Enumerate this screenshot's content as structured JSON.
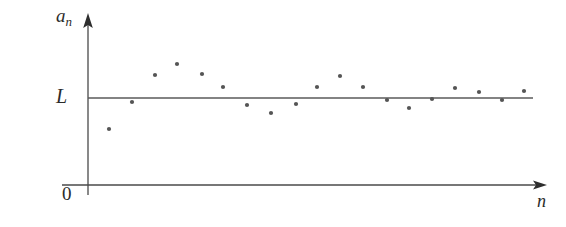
{
  "figure": {
    "background_color": "#ffffff",
    "axis_color": "#4a4a4a",
    "point_color": "#555555",
    "labels": {
      "y_axis": "a",
      "y_axis_subscript": "n",
      "limit_line": "L",
      "origin": "0",
      "x_axis": "n"
    }
  },
  "chart_data": {
    "type": "scatter",
    "title": "",
    "xlabel": "n",
    "ylabel": "a_n",
    "grid": false,
    "legend": false,
    "annotations": [
      {
        "text": "L",
        "meaning": "limit value, horizontal reference line",
        "y_pixel": 98
      },
      {
        "text": "0",
        "meaning": "origin",
        "x_pixel": 88,
        "y_pixel": 185
      }
    ],
    "reference_lines": [
      {
        "name": "limit-line",
        "orientation": "horizontal",
        "label": "L",
        "x_start_px": 88,
        "x_end_px": 533,
        "y_px": 98
      }
    ],
    "axes": {
      "x_axis_px": {
        "x_start": 62,
        "x_end": 547,
        "y": 185,
        "arrow": "right"
      },
      "y_axis_px": {
        "x": 88,
        "y_start": 185,
        "y_end": 14,
        "arrow": "up"
      }
    },
    "x": [
      1,
      2,
      3,
      4,
      5,
      6,
      7,
      8,
      9,
      10,
      11,
      12,
      13,
      14,
      15,
      16,
      17,
      18,
      19
    ],
    "values": [
      -0.72,
      -0.09,
      0.53,
      0.79,
      0.55,
      0.25,
      -0.16,
      -0.34,
      -0.14,
      0.25,
      0.5,
      0.25,
      -0.05,
      -0.23,
      -0.02,
      0.23,
      0.14,
      -0.05,
      0.16
    ],
    "points_px": [
      {
        "x": 109,
        "y": 129
      },
      {
        "x": 132,
        "y": 102
      },
      {
        "x": 155,
        "y": 75
      },
      {
        "x": 177,
        "y": 64
      },
      {
        "x": 202,
        "y": 74
      },
      {
        "x": 223,
        "y": 87
      },
      {
        "x": 247,
        "y": 105
      },
      {
        "x": 271,
        "y": 113
      },
      {
        "x": 296,
        "y": 104
      },
      {
        "x": 317,
        "y": 87
      },
      {
        "x": 340,
        "y": 76
      },
      {
        "x": 363,
        "y": 87
      },
      {
        "x": 387,
        "y": 100
      },
      {
        "x": 409,
        "y": 108
      },
      {
        "x": 432,
        "y": 99
      },
      {
        "x": 455,
        "y": 88
      },
      {
        "x": 479,
        "y": 92
      },
      {
        "x": 502,
        "y": 100
      },
      {
        "x": 524,
        "y": 91
      }
    ],
    "point_radius_px": 2.1
  }
}
